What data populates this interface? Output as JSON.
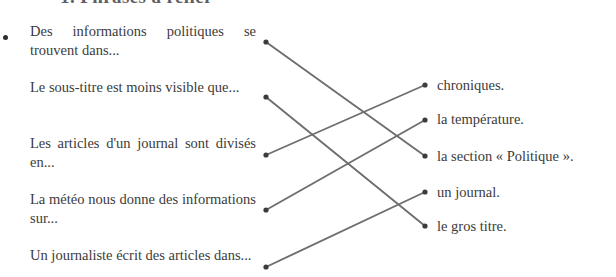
{
  "heading": {
    "text": "1. Phrases à relier",
    "color": "#5e5e64"
  },
  "exercise": {
    "bullet_icon": "bullet-dot-icon",
    "left_column": [
      {
        "id": "L1",
        "text": "Des informations politiques se trouvent dans..."
      },
      {
        "id": "L2",
        "text": "Le sous-titre est moins visible que..."
      },
      {
        "id": "L3",
        "text": "Les articles d'un journal sont divisés en..."
      },
      {
        "id": "L4",
        "text": "La météo nous donne des informations sur..."
      },
      {
        "id": "L5",
        "text": "Un journaliste écrit des articles dans..."
      }
    ],
    "right_column": [
      {
        "id": "R1",
        "text": "chroniques."
      },
      {
        "id": "R2",
        "text": "la température."
      },
      {
        "id": "R3",
        "text": "la section « Politique »."
      },
      {
        "id": "R4",
        "text": "un journal."
      },
      {
        "id": "R5",
        "text": "le gros titre."
      }
    ],
    "matches": [
      {
        "from": "L1",
        "to": "R3"
      },
      {
        "from": "L2",
        "to": "R5"
      },
      {
        "from": "L3",
        "to": "R1"
      },
      {
        "from": "L4",
        "to": "R2"
      },
      {
        "from": "L5",
        "to": "R4"
      }
    ],
    "line_color": "#6e6e6e",
    "dot_color": "#3c3c3c"
  },
  "geometry": {
    "left_text_tops": [
      22,
      78,
      134,
      190,
      246
    ],
    "right_text_tops": [
      76,
      110,
      147,
      183,
      217
    ],
    "left_dot_y": [
      42,
      97,
      155,
      210,
      267
    ],
    "right_dot_y": [
      85,
      120,
      156,
      192,
      226
    ],
    "left_dot_x": 266,
    "right_dot_x": 425
  }
}
